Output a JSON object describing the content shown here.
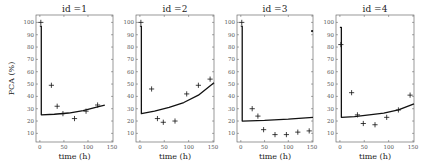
{
  "chart_data": [
    {
      "type": "scatter",
      "title": "id =1",
      "xlabel": "time (h)",
      "ylabel": "PCA (%)",
      "xlim": [
        -8,
        152
      ],
      "ylim": [
        3,
        106
      ],
      "xticks": [
        0,
        50,
        100,
        150
      ],
      "yticks": [
        10,
        20,
        30,
        40,
        50,
        60,
        70,
        80,
        90,
        100
      ],
      "grid": false,
      "series": [
        {
          "name": "observed",
          "marker": "+",
          "x": [
            2,
            24,
            36,
            48,
            72,
            96,
            120
          ],
          "y": [
            100,
            49,
            32,
            26,
            22,
            28,
            33
          ]
        },
        {
          "name": "model",
          "style": "line",
          "x": [
            0,
            3,
            3,
            30,
            60,
            90,
            120,
            135
          ],
          "y": [
            97,
            97,
            25,
            25.5,
            26.5,
            28.5,
            31.5,
            33
          ]
        }
      ]
    },
    {
      "type": "scatter",
      "title": "id =2",
      "xlabel": "time (h)",
      "ylabel": "",
      "xlim": [
        -8,
        152
      ],
      "ylim": [
        3,
        106
      ],
      "xticks": [
        0,
        50,
        100,
        150
      ],
      "yticks": [
        10,
        20,
        30,
        40,
        50,
        60,
        70,
        80,
        90,
        100
      ],
      "grid": false,
      "series": [
        {
          "name": "observed",
          "marker": "+",
          "x": [
            2,
            24,
            36,
            48,
            72,
            96,
            120,
            144
          ],
          "y": [
            100,
            46,
            22,
            19,
            20,
            42,
            49,
            54
          ]
        },
        {
          "name": "model",
          "style": "line",
          "x": [
            0,
            3,
            3,
            30,
            60,
            90,
            120,
            152
          ],
          "y": [
            97,
            97,
            26,
            28,
            31,
            35,
            41,
            51
          ]
        }
      ]
    },
    {
      "type": "scatter",
      "title": "id =3",
      "xlabel": "time (h)",
      "ylabel": "",
      "xlim": [
        -8,
        152
      ],
      "ylim": [
        3,
        106
      ],
      "xticks": [
        0,
        50,
        100,
        150
      ],
      "yticks": [
        10,
        20,
        30,
        40,
        50,
        60,
        70,
        80,
        90,
        100
      ],
      "grid": false,
      "series": [
        {
          "name": "observed",
          "marker": "+",
          "x": [
            2,
            24,
            36,
            48,
            72,
            96,
            120,
            144
          ],
          "y": [
            100,
            30,
            24,
            13,
            9,
            9,
            11,
            12
          ]
        },
        {
          "name": "outlier",
          "marker": ".",
          "x": [
            150
          ],
          "y": [
            93
          ]
        },
        {
          "name": "model",
          "style": "line",
          "x": [
            0,
            3,
            3,
            50,
            100,
            152
          ],
          "y": [
            97,
            97,
            20,
            20.5,
            21.5,
            23
          ]
        }
      ]
    },
    {
      "type": "scatter",
      "title": "id =4",
      "xlabel": "time (h)",
      "ylabel": "",
      "xlim": [
        -8,
        152
      ],
      "ylim": [
        3,
        106
      ],
      "xticks": [
        0,
        50,
        100,
        150
      ],
      "yticks": [
        10,
        20,
        30,
        40,
        50,
        60,
        70,
        80,
        90,
        100
      ],
      "grid": false,
      "series": [
        {
          "name": "observed",
          "marker": "+",
          "x": [
            2,
            24,
            36,
            48,
            72,
            96,
            120,
            144
          ],
          "y": [
            82,
            43,
            25,
            18,
            17,
            23,
            29,
            41
          ]
        },
        {
          "name": "model",
          "style": "line",
          "x": [
            0,
            3,
            3,
            30,
            60,
            90,
            120,
            152
          ],
          "y": [
            96,
            96,
            23,
            23.5,
            25,
            26.5,
            29,
            34
          ]
        }
      ]
    }
  ],
  "panels_px": [
    {
      "left": 36,
      "right": 113,
      "top": 15,
      "bottom": 142
    },
    {
      "left": 136,
      "right": 214,
      "top": 15,
      "bottom": 142
    },
    {
      "left": 237,
      "right": 313,
      "top": 15,
      "bottom": 142
    },
    {
      "left": 336,
      "right": 414,
      "top": 15,
      "bottom": 142
    }
  ],
  "colors": {
    "axis": "#555555",
    "data": "#111111",
    "line": "#111111"
  }
}
